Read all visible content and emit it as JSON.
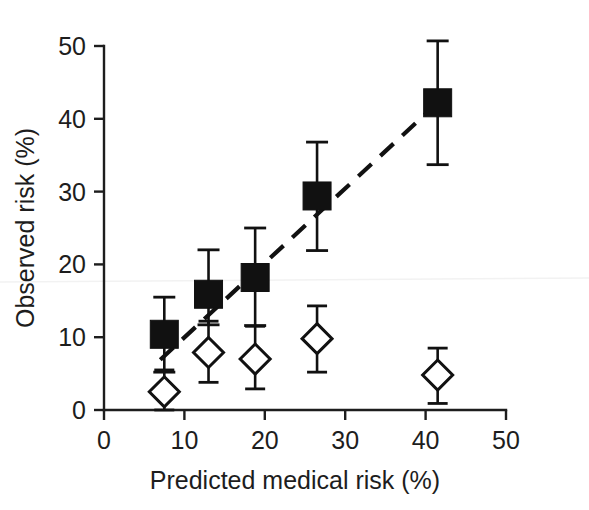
{
  "chart_data": {
    "type": "scatter",
    "title": "",
    "xlabel": "Predicted medical risk (%)",
    "ylabel": "Observed risk (%)",
    "xlim": [
      0,
      50
    ],
    "ylim": [
      0,
      50
    ],
    "xticks": [
      0,
      10,
      20,
      30,
      40,
      50
    ],
    "yticks": [
      0,
      10,
      20,
      30,
      40,
      50
    ],
    "xtick_labels": [
      "0",
      "10",
      "20",
      "30",
      "40",
      "50"
    ],
    "ytick_labels": [
      "0",
      "10",
      "20",
      "30",
      "40",
      "50"
    ],
    "grid": false,
    "legend": "none",
    "x": [
      7.5,
      13.0,
      18.8,
      26.5,
      41.5
    ],
    "series": [
      {
        "name": "filled-square-series",
        "marker": "filled-square",
        "values": [
          10.4,
          15.9,
          18.2,
          29.4,
          42.2
        ],
        "err_low": [
          5.2,
          11.7,
          11.6,
          21.9,
          33.7
        ],
        "err_high": [
          15.5,
          22.0,
          25.0,
          36.8,
          50.7
        ]
      },
      {
        "name": "open-diamond-series",
        "marker": "open-diamond",
        "values": [
          2.5,
          7.9,
          7.0,
          9.8,
          4.8
        ],
        "err_low": [
          0.0,
          3.8,
          2.9,
          5.2,
          0.9
        ],
        "err_high": [
          5.5,
          12.2,
          11.5,
          14.3,
          8.5
        ]
      }
    ],
    "fit_line": {
      "name": "dashed-trend-line",
      "style": "dashed",
      "x": [
        7.0,
        41.5
      ],
      "y": [
        6.9,
        42.2
      ]
    }
  },
  "axes": {
    "x_title": "Predicted medical risk (%)",
    "y_title": "Observed risk (%)",
    "x_ticks": [
      "0",
      "10",
      "20",
      "30",
      "40",
      "50"
    ],
    "y_ticks": [
      "0",
      "10",
      "20",
      "30",
      "40",
      "50"
    ]
  },
  "colors": {
    "foreground": "#111111",
    "background": "#ffffff",
    "marker_fill": "#111111",
    "marker_open": "#ffffff"
  }
}
